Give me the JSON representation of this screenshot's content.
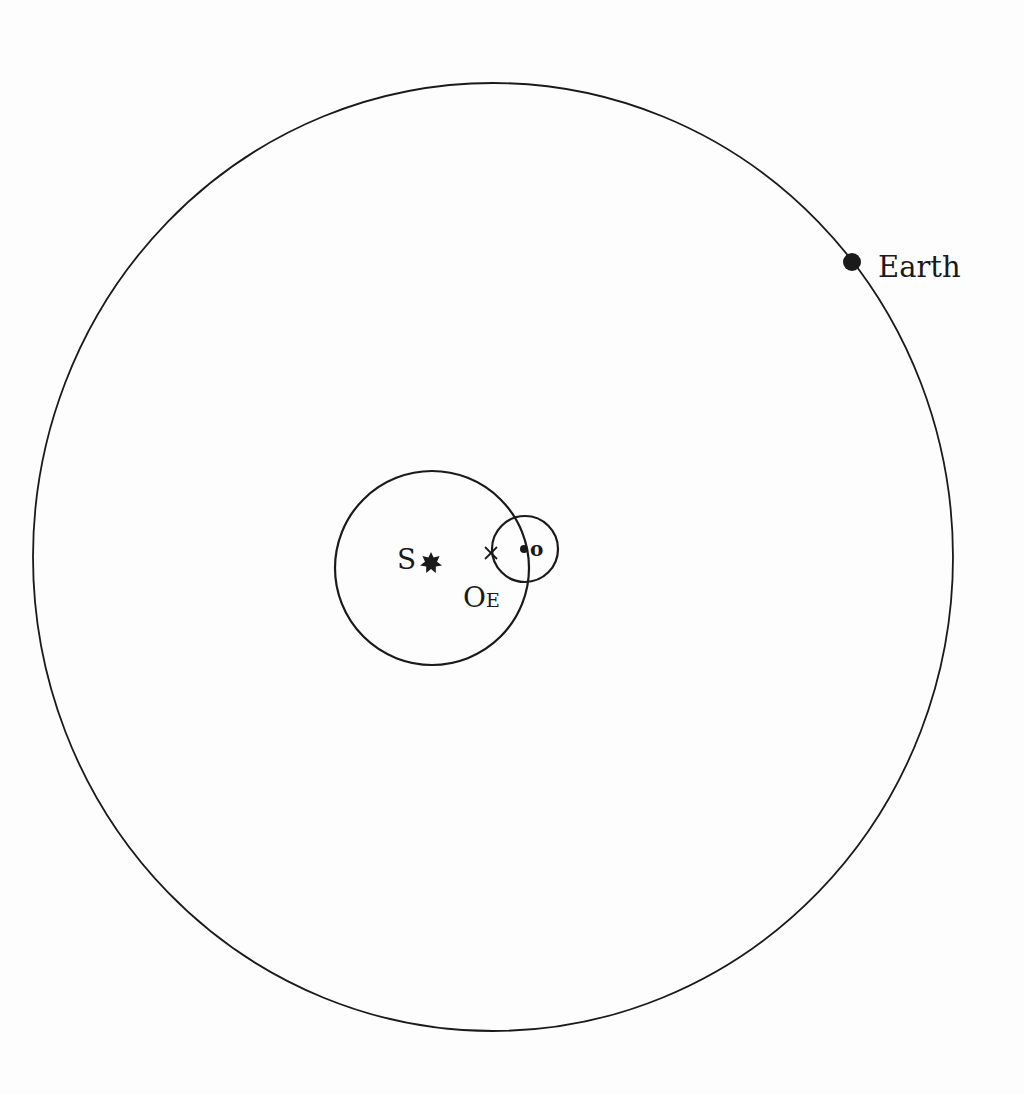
{
  "diagram": {
    "type": "orbital-geometry",
    "colors": {
      "line": "#1a1a1a",
      "background": "#fdfdfd"
    },
    "outer_orbit": {
      "label": "Earth",
      "cx": 493,
      "cy": 557,
      "rx": 460,
      "ry": 474
    },
    "earth": {
      "label": "Earth",
      "x": 852,
      "y": 262,
      "r": 9
    },
    "sun": {
      "label": "S",
      "x": 431,
      "y": 563,
      "r": 10
    },
    "mars_deferent": {
      "cx": 432,
      "cy": 568,
      "r": 97,
      "center_label": "O",
      "center_sub": "E"
    },
    "epicycle": {
      "cx": 525,
      "cy": 549,
      "r": 33,
      "point_label": "o"
    },
    "mean_point_marker": {
      "symbol": "×",
      "x": 491,
      "y": 553
    }
  }
}
